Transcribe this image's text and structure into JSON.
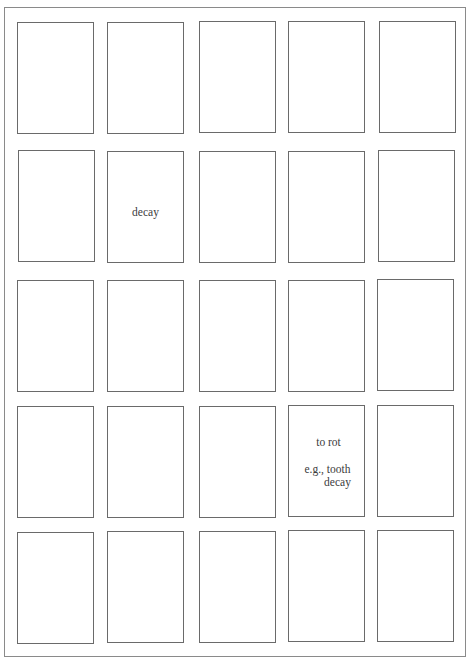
{
  "sheet": {
    "rows": 5,
    "columns": 5,
    "card_count": 25
  },
  "cards": {
    "r2c2": {
      "lines": [
        "decay"
      ]
    },
    "r4c4": {
      "lines": [
        "to rot",
        "e.g., tooth",
        "decay"
      ]
    }
  }
}
